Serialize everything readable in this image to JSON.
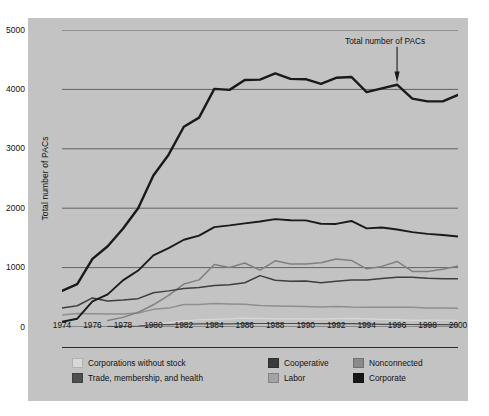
{
  "chart_data": {
    "type": "line",
    "title": "",
    "xlabel": "",
    "ylabel": "Total number of PACs",
    "xlim": [
      1974,
      2000
    ],
    "ylim": [
      0,
      5000
    ],
    "grid": true,
    "legend_position": "bottom",
    "x": [
      1974,
      1975,
      1976,
      1977,
      1978,
      1979,
      1980,
      1981,
      1982,
      1983,
      1984,
      1985,
      1986,
      1987,
      1988,
      1989,
      1990,
      1991,
      1992,
      1993,
      1994,
      1995,
      1996,
      1997,
      1998,
      1999,
      2000
    ],
    "yticks": [
      0,
      1000,
      2000,
      3000,
      4000,
      5000
    ],
    "xticks": [
      1974,
      1976,
      1978,
      1980,
      1982,
      1984,
      1986,
      1988,
      1990,
      1992,
      1994,
      1996,
      1998,
      2000
    ],
    "annotations": [
      {
        "text": "Total number of PACs",
        "x": 1996,
        "y": 4100,
        "arrow": "down"
      }
    ],
    "series": [
      {
        "name": "Total number of PACs",
        "key": "total",
        "color": "#1a1a1a",
        "width": 2.4,
        "values": [
          608,
          722,
          1146,
          1360,
          1653,
          2000,
          2551,
          2901,
          3371,
          3525,
          4009,
          3992,
          4157,
          4165,
          4268,
          4178,
          4172,
          4094,
          4195,
          4210,
          3954,
          4016,
          4079,
          3844,
          3798,
          3798,
          3907
        ]
      },
      {
        "name": "Corporate",
        "key": "corporate",
        "color": "#1a1a1a",
        "width": 1.9,
        "values": [
          89,
          139,
          433,
          550,
          785,
          950,
          1206,
          1327,
          1469,
          1538,
          1682,
          1710,
          1744,
          1775,
          1816,
          1796,
          1795,
          1738,
          1735,
          1785,
          1660,
          1674,
          1642,
          1597,
          1567,
          1548,
          1523
        ]
      },
      {
        "name": "Trade, membership, and health",
        "key": "trade",
        "color": "#3e3e3e",
        "width": 1.5,
        "values": [
          318,
          357,
          489,
          438,
          453,
          477,
          576,
          608,
          649,
          664,
          698,
          710,
          745,
          865,
          786,
          770,
          774,
          745,
          770,
          793,
          792,
          815,
          838,
          838,
          821,
          812,
          812
        ]
      },
      {
        "name": "Nonconnected",
        "key": "nonconnected",
        "color": "#808080",
        "width": 1.5,
        "values": [
          null,
          null,
          null,
          110,
          162,
          247,
          374,
          531,
          723,
          793,
          1053,
          1003,
          1077,
          957,
          1115,
          1060,
          1062,
          1083,
          1145,
          1121,
          980,
          1020,
          1103,
          935,
          935,
          972,
          1026
        ]
      },
      {
        "name": "Labor",
        "key": "labor",
        "color": "#8f8f8f",
        "width": 1.5,
        "values": [
          201,
          226,
          224,
          217,
          217,
          234,
          297,
          318,
          380,
          378,
          394,
          388,
          384,
          364,
          354,
          349,
          346,
          338,
          347,
          337,
          333,
          334,
          332,
          332,
          321,
          318,
          316
        ]
      },
      {
        "name": "Cooperative",
        "key": "cooperative",
        "color": "#4a4a4a",
        "width": 1.2,
        "values": [
          null,
          null,
          null,
          12,
          12,
          16,
          42,
          41,
          47,
          51,
          52,
          54,
          56,
          59,
          59,
          59,
          59,
          57,
          56,
          56,
          53,
          44,
          43,
          42,
          41,
          41,
          40
        ]
      },
      {
        "name": "Corporations without stock",
        "key": "corp_without_stock",
        "color": "#d8d8d8",
        "width": 1.2,
        "values": [
          null,
          null,
          null,
          24,
          24,
          20,
          56,
          68,
          103,
          122,
          130,
          136,
          151,
          145,
          138,
          136,
          136,
          133,
          142,
          146,
          136,
          129,
          123,
          111,
          115,
          114,
          114
        ]
      }
    ]
  },
  "axis": {
    "y_tick_labels": [
      "5000",
      "4000",
      "3000",
      "2000",
      "1000",
      "0"
    ],
    "x_tick_labels": [
      "1974",
      "1976",
      "1978",
      "1980",
      "1982",
      "1984",
      "1986",
      "1988",
      "1990",
      "1992",
      "1994",
      "1996",
      "1998",
      "2000"
    ],
    "y_axis_title": "Total number of PACs"
  },
  "annotation": {
    "label": "Total number of PACs"
  },
  "legend": {
    "row1": [
      {
        "label": "Corporations without stock",
        "color": "#d8d8d8"
      },
      {
        "label": "Cooperative",
        "color": "#3a3a3a"
      },
      {
        "label": "Nonconnected",
        "color": "#8a8a8a"
      }
    ],
    "row2": [
      {
        "label": "Trade, membership, and health",
        "color": "#4f4f4f"
      },
      {
        "label": "Labor",
        "color": "#a2a2a2"
      },
      {
        "label": "Corporate",
        "color": "#161616"
      }
    ]
  },
  "colors": {
    "panel_background": "#c3c3c3",
    "page_background": "#ffffff",
    "grid": "#4a4a4a",
    "text": "#111111"
  }
}
